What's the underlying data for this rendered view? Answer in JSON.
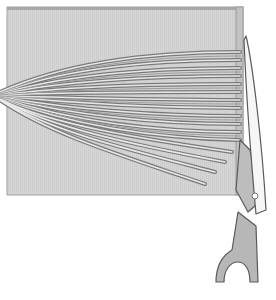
{
  "illustration": {
    "subject": "Yarn wrapped around a square of cardboard, being cut with scissors along the right edge",
    "colors": {
      "background": "#ffffff",
      "cardboard": "#d4d4d4",
      "cardboard_edge": "#9a9a9a",
      "yarn_light": "#e2e2e2",
      "yarn_dark": "#6e6e6e",
      "scissors_blade": "#f4f4f4",
      "scissors_handle": "#b9b9b9",
      "outline": "#5a5a5a"
    },
    "elements": [
      "cardboard-square",
      "yarn-bundle",
      "scissors"
    ]
  }
}
